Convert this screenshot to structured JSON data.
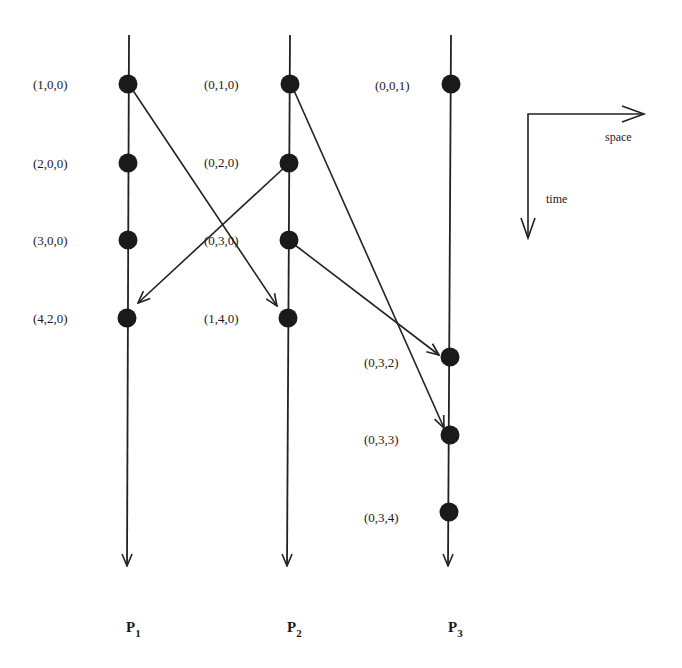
{
  "diagram": {
    "colors": {
      "line": "#222222",
      "dot": "#1a1a1a",
      "text": "#1a1a1a",
      "background": "#ffffff"
    },
    "legend": {
      "space_label": "space",
      "time_label": "time"
    },
    "processes": [
      {
        "id": "P1",
        "name": "P",
        "subscript": "1",
        "events": [
          {
            "timestamp": "(1,0,0)"
          },
          {
            "timestamp": "(2,0,0)"
          },
          {
            "timestamp": "(3,0,0)"
          },
          {
            "timestamp": "(4,2,0)"
          }
        ]
      },
      {
        "id": "P2",
        "name": "P",
        "subscript": "2",
        "events": [
          {
            "timestamp": "(0,1,0)"
          },
          {
            "timestamp": "(0,2,0)"
          },
          {
            "timestamp": "(0,3,0)"
          },
          {
            "timestamp": "(1,4,0)"
          }
        ]
      },
      {
        "id": "P3",
        "name": "P",
        "subscript": "3",
        "events": [
          {
            "timestamp": "(0,0,1)"
          },
          {
            "timestamp": "(0,3,2)"
          },
          {
            "timestamp": "(0,3,3)"
          },
          {
            "timestamp": "(0,3,4)"
          }
        ]
      }
    ],
    "messages": [
      {
        "from": "(1,0,0)",
        "to": "(1,4,0)"
      },
      {
        "from": "(0,2,0)",
        "to": "(4,2,0)"
      },
      {
        "from": "(0,1,0)",
        "to": "(0,3,3)"
      },
      {
        "from": "(0,3,0)",
        "to": "(0,3,2)"
      }
    ]
  }
}
